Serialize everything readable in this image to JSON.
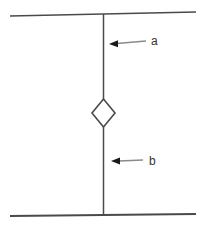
{
  "diagram": {
    "background_color": "#ffffff",
    "line_color": "#4a4a4a",
    "node": {
      "shape": "diamond",
      "fill": "#ffffff",
      "stroke": "#3a3a3a"
    },
    "arrows": {
      "shaft_color": "#8a8a8a",
      "head_color": "#1a1a1a",
      "label_color": "#333333"
    },
    "annotations": [
      {
        "label": "a"
      },
      {
        "label": "b"
      }
    ]
  }
}
